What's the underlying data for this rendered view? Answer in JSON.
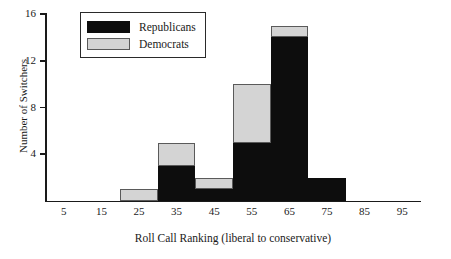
{
  "chart_data": {
    "type": "bar",
    "subtype": "stacked-histogram",
    "title": "",
    "xlabel": "Roll Call Ranking (liberal to conservative)",
    "ylabel": "Number of Switchers",
    "categories": [
      "5",
      "15",
      "25",
      "35",
      "45",
      "55",
      "65",
      "75",
      "85",
      "95"
    ],
    "bin_centers": [
      5,
      15,
      25,
      35,
      45,
      55,
      65,
      75,
      85,
      95
    ],
    "bin_width": 10,
    "xlim": [
      0,
      100
    ],
    "ylim": [
      0,
      16
    ],
    "xticks": [
      "5",
      "15",
      "25",
      "35",
      "45",
      "55",
      "65",
      "75",
      "85",
      "95"
    ],
    "yticks": [
      "4",
      "8",
      "12",
      "16"
    ],
    "grid": false,
    "legend_position": "top-left",
    "series": [
      {
        "name": "Republicans",
        "color": "#0d0d0d",
        "values": [
          0,
          0,
          0,
          3,
          1,
          5,
          14,
          2,
          0,
          0
        ]
      },
      {
        "name": "Democrats",
        "color": "#d4d4d4",
        "values": [
          0,
          0,
          1,
          2,
          1,
          5,
          1,
          0,
          0,
          0
        ]
      }
    ],
    "totals": [
      0,
      0,
      1,
      5,
      2,
      10,
      15,
      2,
      0,
      0
    ]
  },
  "legend": {
    "items": [
      {
        "label": "Republicans",
        "swatch": "black-swatch"
      },
      {
        "label": "Democrats",
        "swatch": "gray-swatch"
      }
    ]
  },
  "axes": {
    "y_title": "Number of Switchers",
    "x_title": "Roll Call Ranking (liberal to conservative)",
    "y_tick_labels": [
      "16",
      "12",
      "8",
      "4"
    ],
    "x_tick_labels": [
      "5",
      "15",
      "25",
      "35",
      "45",
      "55",
      "65",
      "75",
      "85",
      "95"
    ]
  }
}
